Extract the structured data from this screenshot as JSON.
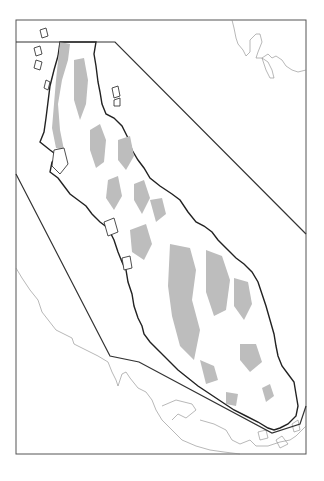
{
  "map": {
    "type": "peninsula outline map",
    "width": 324,
    "height": 481,
    "colors": {
      "background": "#ffffff",
      "frame": "#555555",
      "boundary_polygon": "#333333",
      "coastline": "#222222",
      "neighbor_coast": "#888888",
      "highland_fill": "#bdbdbd",
      "land_fill": "#ffffff"
    },
    "frame": {
      "x": 16,
      "y": 20,
      "width": 290,
      "height": 434
    },
    "boundary_polygon_points": "16,42 115,42 306,234 306,406 300,424 272,433 139,362 110,356 16,174",
    "labels": []
  }
}
